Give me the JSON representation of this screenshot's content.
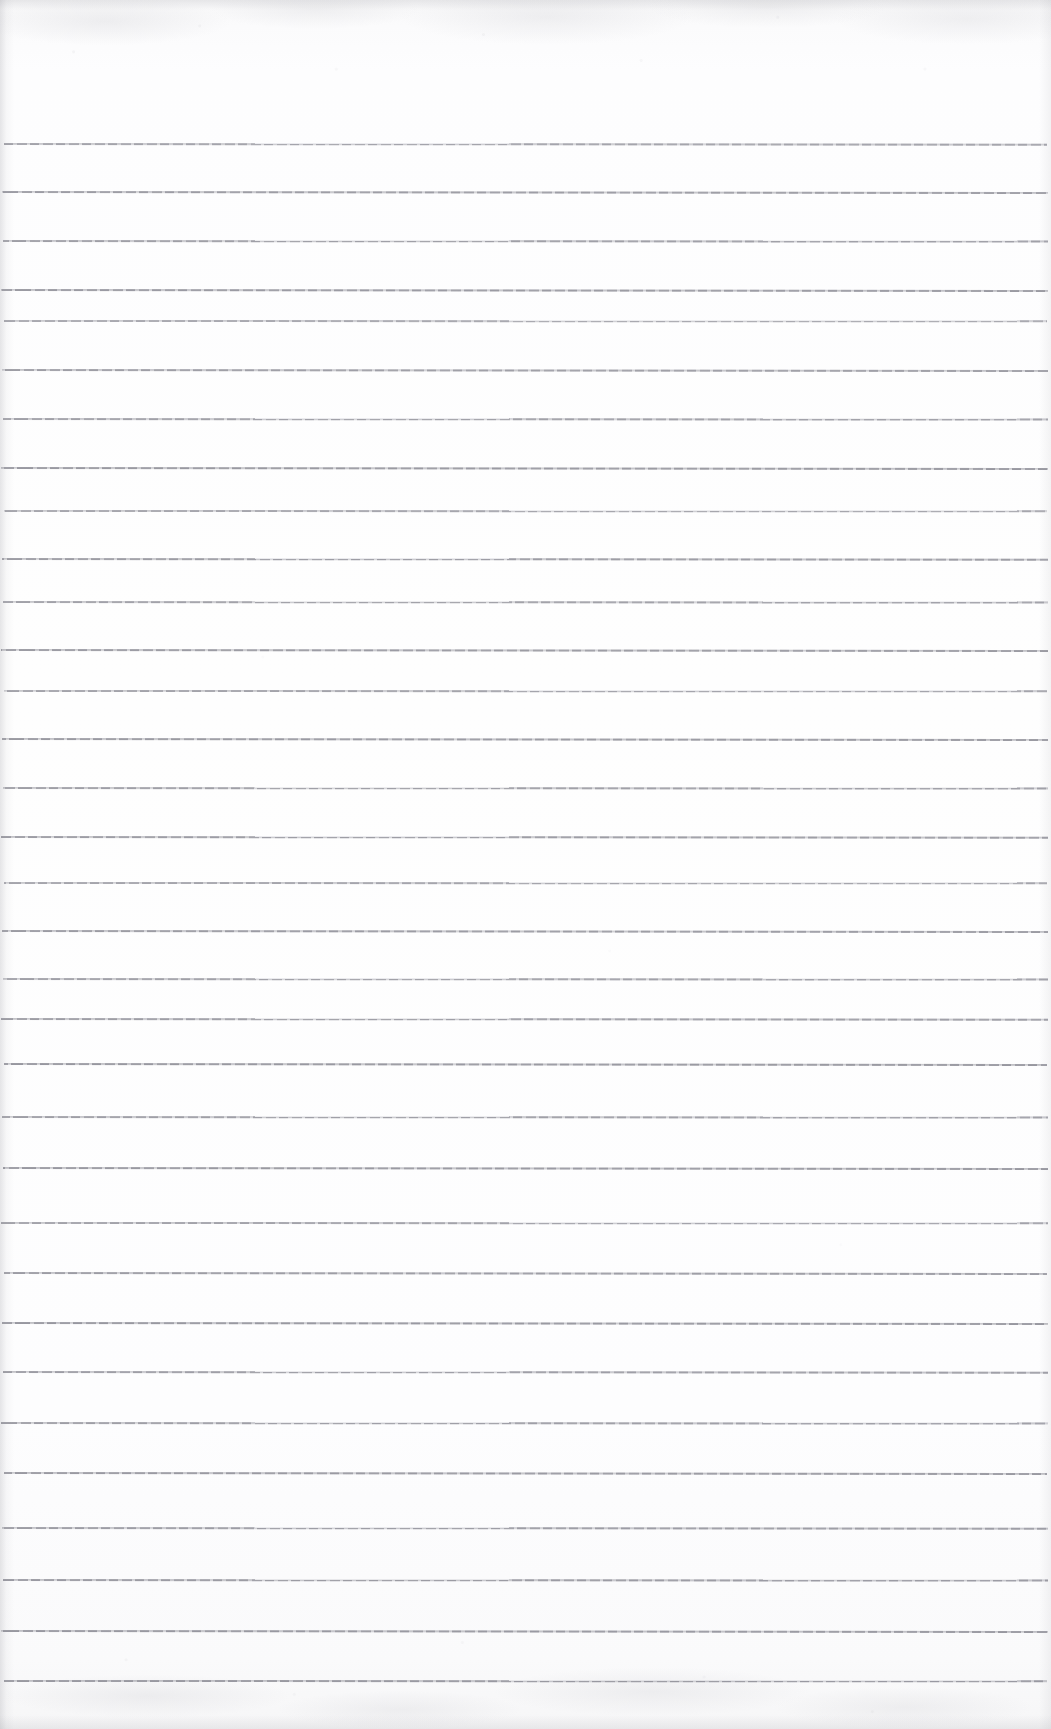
{
  "document": {
    "kind": "scanned-lined-paper",
    "title": "Blank ruled notebook page",
    "page_width": 1051,
    "page_height": 1729,
    "orientation": "portrait",
    "content_text": "",
    "has_handwriting": false,
    "has_printed_text": false,
    "has_margin_rule": false,
    "has_header": false,
    "has_footer": false
  },
  "colors": {
    "paper": "#fdfdfe",
    "paper_shade": "#f7f7f8",
    "rule_line": "#7a7a84",
    "edge_shadow": "#8c8c94"
  },
  "ruling": {
    "style": "horizontal-ruled",
    "line_count": 32,
    "line_thickness_px": 1,
    "average_spacing_px": 49,
    "first_line_y": 143,
    "last_line_y": 1680,
    "left_inset_px": 4,
    "right_inset_px": 4,
    "lines": [
      {
        "y": 143,
        "x": 4,
        "width": 1043,
        "tilt": 0.04,
        "opacity": 0.74
      },
      {
        "y": 191,
        "x": 2,
        "width": 1046,
        "tilt": 0.06,
        "opacity": 0.8
      },
      {
        "y": 240,
        "x": 3,
        "width": 1045,
        "tilt": 0.03,
        "opacity": 0.78
      },
      {
        "y": 289,
        "x": 1,
        "width": 1047,
        "tilt": 0.05,
        "opacity": 0.82
      },
      {
        "y": 320,
        "x": 4,
        "width": 1043,
        "tilt": 0.02,
        "opacity": 0.7
      },
      {
        "y": 369,
        "x": 2,
        "width": 1046,
        "tilt": 0.05,
        "opacity": 0.79
      },
      {
        "y": 418,
        "x": 3,
        "width": 1045,
        "tilt": 0.03,
        "opacity": 0.77
      },
      {
        "y": 467,
        "x": 1,
        "width": 1047,
        "tilt": 0.06,
        "opacity": 0.83
      },
      {
        "y": 510,
        "x": 4,
        "width": 1043,
        "tilt": 0.02,
        "opacity": 0.72
      },
      {
        "y": 558,
        "x": 2,
        "width": 1046,
        "tilt": 0.04,
        "opacity": 0.8
      },
      {
        "y": 601,
        "x": 3,
        "width": 1045,
        "tilt": 0.03,
        "opacity": 0.76
      },
      {
        "y": 649,
        "x": 1,
        "width": 1047,
        "tilt": 0.05,
        "opacity": 0.81
      },
      {
        "y": 690,
        "x": 4,
        "width": 1043,
        "tilt": 0.02,
        "opacity": 0.74
      },
      {
        "y": 738,
        "x": 2,
        "width": 1046,
        "tilt": 0.05,
        "opacity": 0.82
      },
      {
        "y": 787,
        "x": 3,
        "width": 1045,
        "tilt": 0.03,
        "opacity": 0.78
      },
      {
        "y": 836,
        "x": 1,
        "width": 1047,
        "tilt": 0.04,
        "opacity": 0.8
      },
      {
        "y": 882,
        "x": 4,
        "width": 1043,
        "tilt": 0.02,
        "opacity": 0.73
      },
      {
        "y": 930,
        "x": 2,
        "width": 1046,
        "tilt": 0.05,
        "opacity": 0.81
      },
      {
        "y": 978,
        "x": 3,
        "width": 1045,
        "tilt": 0.03,
        "opacity": 0.77
      },
      {
        "y": 1018,
        "x": 1,
        "width": 1047,
        "tilt": 0.04,
        "opacity": 0.79
      },
      {
        "y": 1063,
        "x": 4,
        "width": 1043,
        "tilt": 0.05,
        "opacity": 0.84
      },
      {
        "y": 1116,
        "x": 2,
        "width": 1046,
        "tilt": 0.03,
        "opacity": 0.78
      },
      {
        "y": 1167,
        "x": 3,
        "width": 1045,
        "tilt": 0.06,
        "opacity": 0.83
      },
      {
        "y": 1222,
        "x": 1,
        "width": 1047,
        "tilt": 0.02,
        "opacity": 0.75
      },
      {
        "y": 1272,
        "x": 4,
        "width": 1043,
        "tilt": 0.05,
        "opacity": 0.8
      },
      {
        "y": 1322,
        "x": 2,
        "width": 1046,
        "tilt": 0.06,
        "opacity": 0.84
      },
      {
        "y": 1371,
        "x": 3,
        "width": 1045,
        "tilt": 0.04,
        "opacity": 0.79
      },
      {
        "y": 1422,
        "x": 1,
        "width": 1047,
        "tilt": 0.03,
        "opacity": 0.78
      },
      {
        "y": 1472,
        "x": 4,
        "width": 1043,
        "tilt": 0.05,
        "opacity": 0.82
      },
      {
        "y": 1527,
        "x": 2,
        "width": 1046,
        "tilt": 0.04,
        "opacity": 0.8
      },
      {
        "y": 1579,
        "x": 3,
        "width": 1045,
        "tilt": 0.03,
        "opacity": 0.81
      },
      {
        "y": 1630,
        "x": 1,
        "width": 1047,
        "tilt": 0.05,
        "opacity": 0.83
      },
      {
        "y": 1680,
        "x": 4,
        "width": 1043,
        "tilt": 0.02,
        "opacity": 0.82
      }
    ]
  }
}
